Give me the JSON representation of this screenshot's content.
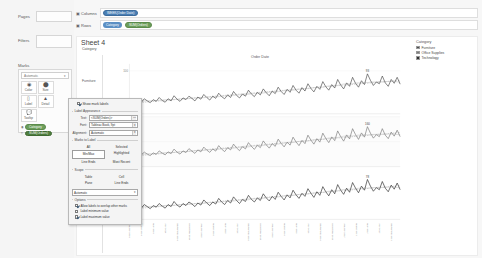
{
  "shelves": {
    "pages_label": "Pages",
    "filters_label": "Filters",
    "columns_label": "Columns",
    "rows_label": "Rows",
    "columns_pills": [
      {
        "text": "WEEK(Order Date)",
        "color": "blue"
      }
    ],
    "rows_pills": [
      {
        "text": "Category",
        "color": "blue"
      },
      {
        "text": "SUM(Orders)",
        "color": "green"
      }
    ]
  },
  "marks": {
    "title": "Marks",
    "type_value": "Automatic",
    "buttons": [
      {
        "label": "Color",
        "icon": "color-icon"
      },
      {
        "label": "Size",
        "icon": "size-icon"
      },
      {
        "label": "Label",
        "icon": "label-icon"
      },
      {
        "label": "Detail",
        "icon": "detail-icon"
      },
      {
        "label": "Tooltip",
        "icon": "tooltip-icon"
      }
    ],
    "pills": [
      {
        "text": "Category",
        "color": "green",
        "icon": "color-pill-icon"
      },
      {
        "text": "SUM(Orders)",
        "color": "green2",
        "icon": "label-pill-icon"
      }
    ]
  },
  "sheet": {
    "title": "Sheet 4",
    "row_header_title": "Category",
    "chart_title": "Order Date",
    "y_axis_title": "Number of Orders",
    "row_headers": [
      "Furniture",
      "Office Supplies",
      "Technology"
    ]
  },
  "legend": {
    "title": "Category",
    "items": [
      {
        "label": "Furniture",
        "color": "#4c4c4c"
      },
      {
        "label": "Office Supplies",
        "color": "#7a7a7a"
      },
      {
        "label": "Technology",
        "color": "#2f2f2f"
      }
    ]
  },
  "dialog": {
    "show_mark_labels": "Show mark labels",
    "label_appearance_title": "Label Appearance",
    "text_label": "Text:",
    "text_value": "<SUM(Orders)>",
    "font_label": "Font:",
    "font_value": "Tableau Book, 9pt",
    "alignment_label": "Alignment:",
    "alignment_value": "Automatic",
    "marks_to_label_title": "Marks to Label",
    "marks_to_label_buttons": [
      "All",
      "Selected",
      "Min/Max",
      "Highlighted",
      "Line Ends",
      "Most Recent"
    ],
    "marks_to_label_selected": "Min/Max",
    "scope_title": "Scope",
    "scope_buttons": [
      "Table",
      "Cell",
      "Pane",
      "Line Ends"
    ],
    "scope_dropdown_value": "Automatic",
    "options_title": "Options",
    "options": [
      {
        "label": "Allow labels to overlap other marks",
        "checked": true
      },
      {
        "label": "Label minimum value",
        "checked": false
      },
      {
        "label": "Label maximum value",
        "checked": true
      }
    ]
  },
  "chart_data": {
    "type": "line",
    "title": "Order Date",
    "xlabel": "Order Date",
    "ylabel": "Number of Orders",
    "grid": true,
    "legend_position": "right",
    "ylim": [
      0,
      250
    ],
    "yticks": [
      100,
      200
    ],
    "x_tick_labels": [
      "January 2014",
      "March 2014",
      "May 2014",
      "July 2014",
      "September 2014",
      "November 2014",
      "January 2015",
      "March 2015",
      "May 2015",
      "July 2015",
      "September 2015",
      "November 2015",
      "January 2016",
      "March 2016",
      "May 2016",
      "July 2016",
      "September 2016",
      "November 2016",
      "January 2017",
      "March 2017",
      "May 2017",
      "July 2017",
      "September 2017",
      "November 2017"
    ],
    "series": [
      {
        "name": "Furniture",
        "max_label": "93",
        "values": [
          22,
          28,
          24,
          31,
          27,
          35,
          30,
          26,
          33,
          29,
          38,
          31,
          27,
          35,
          30,
          42,
          34,
          29,
          37,
          33,
          41,
          36,
          30,
          39,
          34,
          45,
          38,
          32,
          41,
          36,
          48,
          40,
          35,
          44,
          38,
          52,
          43,
          37,
          46,
          41,
          55,
          46,
          40,
          50,
          44,
          58,
          49,
          42,
          53,
          47,
          62,
          52,
          45,
          57,
          50,
          66,
          55,
          48,
          61,
          53,
          70,
          59,
          51,
          64,
          57,
          75,
          63,
          55,
          68,
          60,
          80,
          67,
          58,
          72,
          64,
          85,
          71,
          62,
          77,
          68,
          93,
          78,
          66,
          74,
          70,
          88,
          72,
          64,
          80,
          71,
          85,
          69
        ]
      },
      {
        "name": "Office Supplies",
        "max_label": "160",
        "values": [
          38,
          45,
          41,
          52,
          47,
          58,
          50,
          44,
          55,
          49,
          63,
          54,
          47,
          59,
          52,
          70,
          58,
          50,
          63,
          56,
          72,
          62,
          53,
          67,
          59,
          78,
          66,
          57,
          71,
          62,
          84,
          70,
          60,
          76,
          67,
          90,
          75,
          64,
          80,
          71,
          96,
          81,
          69,
          86,
          76,
          103,
          87,
          74,
          92,
          81,
          110,
          93,
          79,
          98,
          86,
          118,
          99,
          84,
          105,
          92,
          126,
          106,
          90,
          112,
          98,
          134,
          113,
          96,
          119,
          104,
          143,
          120,
          102,
          127,
          111,
          152,
          128,
          109,
          135,
          118,
          160,
          134,
          114,
          128,
          120,
          152,
          126,
          112,
          138,
          122,
          146,
          120
        ]
      },
      {
        "name": "Technology",
        "max_label": "78",
        "values": [
          18,
          23,
          20,
          26,
          22,
          29,
          25,
          21,
          27,
          24,
          31,
          26,
          22,
          29,
          25,
          35,
          28,
          24,
          31,
          27,
          34,
          30,
          25,
          32,
          28,
          38,
          32,
          27,
          34,
          30,
          41,
          34,
          29,
          37,
          32,
          44,
          37,
          31,
          39,
          35,
          47,
          39,
          34,
          42,
          37,
          50,
          42,
          36,
          45,
          39,
          53,
          45,
          38,
          48,
          42,
          57,
          48,
          41,
          51,
          45,
          60,
          51,
          43,
          54,
          47,
          64,
          54,
          46,
          58,
          50,
          68,
          57,
          49,
          61,
          53,
          72,
          61,
          52,
          65,
          57,
          78,
          65,
          55,
          62,
          58,
          74,
          61,
          54,
          67,
          59,
          71,
          58
        ]
      }
    ],
    "trend_lines": [
      "linear",
      "polynomial"
    ]
  }
}
